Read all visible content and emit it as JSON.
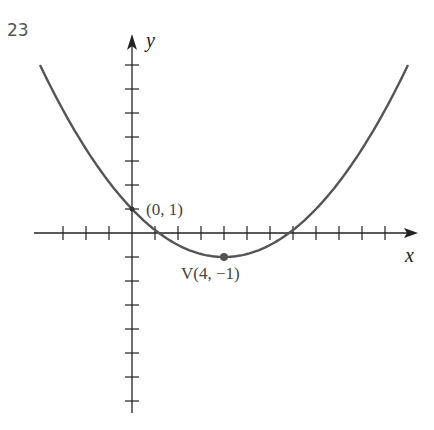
{
  "problem": {
    "number": "23"
  },
  "chart_data": {
    "type": "line",
    "title": "",
    "xlabel": "x",
    "ylabel": "y",
    "function": "y = (x - 4)^2 / 8 - 1",
    "x_ticks": [
      -3,
      -2,
      -1,
      1,
      2,
      3,
      4,
      5,
      6,
      7,
      8,
      9,
      10,
      11
    ],
    "y_ticks": [
      -7,
      -6,
      -5,
      -4,
      -3,
      -2,
      -1,
      1,
      2,
      3,
      4,
      5,
      6,
      7
    ],
    "xlim": [
      -4,
      12
    ],
    "ylim": [
      -7.5,
      8
    ],
    "grid": false,
    "x": [
      -4,
      -2,
      0,
      2,
      4,
      6,
      8,
      10,
      12
    ],
    "series": [
      {
        "name": "parabola",
        "values": [
          7,
          3.5,
          1,
          -0.5,
          -1,
          -0.5,
          1,
          3.5,
          7
        ]
      }
    ],
    "annotations": [
      {
        "label": "(0, 1)",
        "x": 0,
        "y": 1
      },
      {
        "label": "V(4, −1)",
        "x": 4,
        "y": -1,
        "marker": "dot"
      }
    ],
    "colors": {
      "curve": "#555555",
      "axes": "#222222"
    }
  }
}
